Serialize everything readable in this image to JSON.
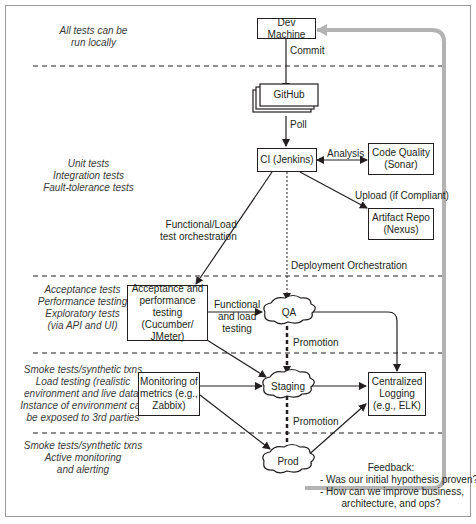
{
  "diagram": {
    "tiers": [
      {
        "id": "local",
        "notes": [
          "All tests can be",
          "run locally"
        ]
      },
      {
        "id": "ci",
        "notes": [
          "Unit tests",
          "Integration tests",
          "Fault-tolerance tests"
        ]
      },
      {
        "id": "qa",
        "notes": [
          "Acceptance tests",
          "Performance testing",
          "Exploratory tests",
          "(via API and UI)"
        ]
      },
      {
        "id": "staging",
        "notes": [
          "Smoke tests/synthetic txns",
          "Load testing (realistic",
          "environment and live data)",
          "Instance of environment can",
          "be exposed to 3rd parties"
        ]
      },
      {
        "id": "prod",
        "notes": [
          "Smoke tests/synthetic txns",
          "Active monitoring",
          "and alerting"
        ]
      }
    ],
    "nodes": {
      "dev_machine": "Dev Machine",
      "github": "GitHub",
      "ci": "CI (Jenkins)",
      "code_quality": [
        "Code Quality",
        "(Sonar)"
      ],
      "artifact_repo": [
        "Artifact Repo",
        "(Nexus)"
      ],
      "acceptance": [
        "Acceptance and",
        "performance",
        "testing (Cucumber/",
        "JMeter)"
      ],
      "monitoring": [
        "Monitoring of",
        "metrics (e.g.,",
        "Zabbix)"
      ],
      "logging": [
        "Centralized",
        "Logging",
        "(e.g., ELK)"
      ],
      "qa": "QA",
      "staging": "Staging",
      "prod": "Prod"
    },
    "edges": {
      "commit": "Commit",
      "poll": "Poll",
      "analysis": "Analysis",
      "upload": "Upload (if Compliant)",
      "func_load_orch": [
        "Functional/Load",
        "test orchestration"
      ],
      "deploy_orch": "Deployment Orchestration",
      "func_load_testing": [
        "Functional",
        "and load",
        "testing"
      ],
      "promotion_1": "Promotion",
      "promotion_2": "Promotion"
    },
    "feedback": [
      "Feedback:",
      "- Was our initial hypothesis proven?",
      "- How can we improve business,",
      "architecture, and ops?"
    ],
    "colors": {
      "line": "#231f20",
      "feedback_arrow": "#b3b3b3",
      "frame": "#9a9a9a"
    }
  }
}
